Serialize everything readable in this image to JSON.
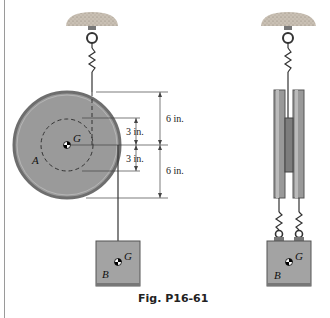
{
  "figure": {
    "caption": "Fig. P16-61",
    "labels": {
      "disk": "A",
      "block": "B",
      "center_disk": "G",
      "center_block_front": "G",
      "center_block_side": "G",
      "block_side": "B"
    },
    "dimensions": {
      "outer_top": "6 in.",
      "inner_top": "3 in.",
      "inner_bottom": "3 in.",
      "outer_bottom": "6 in."
    },
    "colors": {
      "disk_fill": "#9a9a9a",
      "disk_rim": "#6e6e6e",
      "block_fill": "#a3a3a3",
      "ceiling": "#bdb3a6",
      "line": "#333333"
    }
  }
}
